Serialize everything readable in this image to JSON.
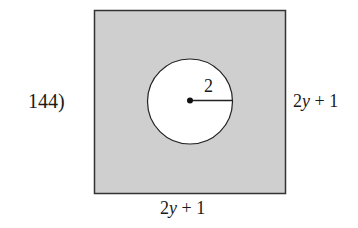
{
  "problem": {
    "number_label": "144)"
  },
  "figure": {
    "square": {
      "side_expression": "2y + 1",
      "fill_color": "#cfcfcf",
      "stroke_color": "#333333"
    },
    "circle": {
      "radius_label": "2",
      "fill_color": "#ffffff",
      "stroke_color": "#222222"
    },
    "labels": {
      "right_side": {
        "coef": "2",
        "var": "y",
        "rest": " + 1"
      },
      "bottom_side": {
        "coef": "2",
        "var": "y",
        "rest": " + 1"
      },
      "radius": "2"
    }
  }
}
